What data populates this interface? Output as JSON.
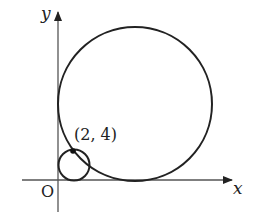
{
  "diagram": {
    "type": "coordinate-geometry",
    "axes": {
      "x_label": "x",
      "y_label": "y",
      "origin_label": "O"
    },
    "point": {
      "label": "(2, 4)",
      "x": 2,
      "y": 4
    },
    "circles": [
      {
        "name": "small-circle",
        "description": "circle through (2, 4) tangent to both axes (smaller)"
      },
      {
        "name": "large-circle",
        "description": "circle through (2, 4) tangent to both axes (larger)"
      }
    ],
    "colors": {
      "stroke": "#222222",
      "axis": "#555555",
      "background": "#ffffff"
    }
  }
}
